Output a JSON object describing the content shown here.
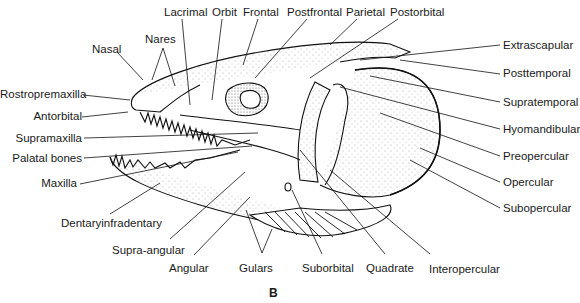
{
  "figure": {
    "panel_label": "B"
  },
  "labels": {
    "lacrimal": "Lacrimal",
    "orbit": "Orbit",
    "frontal": "Frontal",
    "postfrontal": "Postfrontal",
    "parietal": "Parietal",
    "postorbital": "Postorbital",
    "nasal": "Nasal",
    "nares": "Nares",
    "rostropremaxilla": "Rostropremaxilla",
    "antorbital": "Antorbital",
    "supramaxilla": "Supramaxilla",
    "palatal_bones": "Palatal bones",
    "maxilla": "Maxilla",
    "dentaryinfradentary": "Dentaryinfradentary",
    "supra_angular": "Supra-angular",
    "angular": "Angular",
    "gulars": "Gulars",
    "suborbital": "Suborbital",
    "quadrate": "Quadrate",
    "interopercular": "Interopercular",
    "extrascapular": "Extrascapular",
    "posttemporal": "Posttemporal",
    "supratemporal": "Supratemporal",
    "hyomandibular": "Hyomandibular",
    "preopercular": "Preopercular",
    "opercular": "Opercular",
    "subopercular": "Subopercular"
  }
}
